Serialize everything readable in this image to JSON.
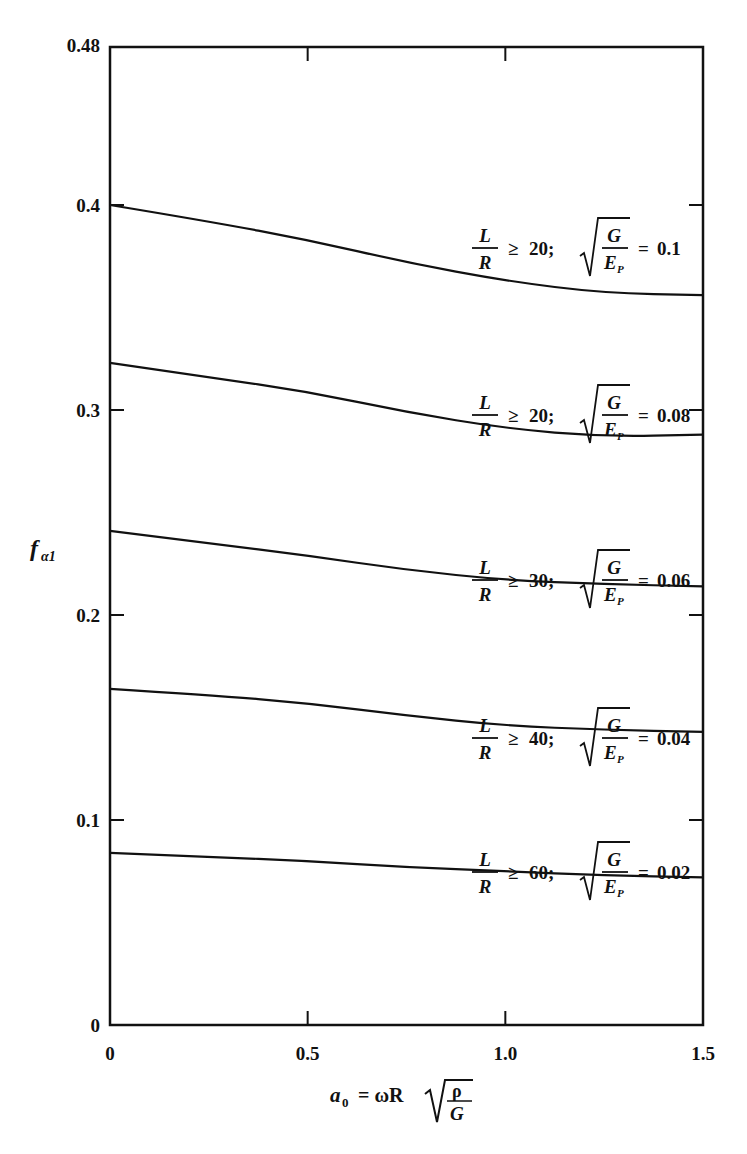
{
  "chart_data": {
    "type": "line",
    "title": "",
    "xlabel": "a0 = ωR √(ρ/G)",
    "ylabel": "f_α1",
    "xlim": [
      0,
      1.5
    ],
    "ylim": [
      0,
      0.48
    ],
    "x_ticks": [
      "0",
      "0.5",
      "1.0",
      "1.5"
    ],
    "y_ticks": [
      "0",
      "0.1",
      "0.2",
      "0.3",
      "0.4",
      "0.48"
    ],
    "grid": false,
    "legend_position": "inline labels above each curve, right side",
    "x": [
      0,
      0.25,
      0.5,
      0.75,
      1.0,
      1.25,
      1.5
    ],
    "series": [
      {
        "name": "L/R ≥ 20; √(G/E_P) = 0.1",
        "lr": "20",
        "ratio": "0.1",
        "values": [
          0.4,
          0.392,
          0.383,
          0.372,
          0.363,
          0.357,
          0.356
        ]
      },
      {
        "name": "L/R ≥ 20; √(G/E_P) = 0.08",
        "lr": "20",
        "ratio": "0.08",
        "values": [
          0.323,
          0.316,
          0.309,
          0.299,
          0.291,
          0.287,
          0.288
        ]
      },
      {
        "name": "L/R ≥ 30; √(G/E_P) = 0.06",
        "lr": "30",
        "ratio": "0.06",
        "values": [
          0.241,
          0.235,
          0.229,
          0.222,
          0.217,
          0.215,
          0.214
        ]
      },
      {
        "name": "L/R ≥ 40; √(G/E_P) = 0.04",
        "lr": "40",
        "ratio": "0.04",
        "values": [
          0.164,
          0.161,
          0.157,
          0.151,
          0.146,
          0.144,
          0.143
        ]
      },
      {
        "name": "L/R ≥ 60; √(G/E_P) = 0.02",
        "lr": "60",
        "ratio": "0.02",
        "values": [
          0.084,
          0.082,
          0.08,
          0.077,
          0.075,
          0.073,
          0.072
        ]
      }
    ]
  },
  "axis": {
    "y_label_main": "f",
    "y_label_sub": "α1",
    "x_label_lhs": "a",
    "x_label_lhs_sub": "0",
    "x_label_eq": "= ωR",
    "x_label_num": "ρ",
    "x_label_den": "G"
  },
  "label_parts": {
    "L": "L",
    "R": "R",
    "geq": "≥",
    "G": "G",
    "E": "E",
    "P": "P",
    "eq": "="
  }
}
